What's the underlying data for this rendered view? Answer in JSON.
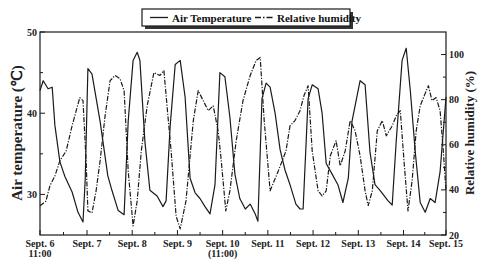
{
  "chart_data": {
    "type": "line",
    "title": "",
    "legend": {
      "position": "top-center",
      "entries": [
        {
          "label": "Air Temperature",
          "style": "solid"
        },
        {
          "label": "Relative humidity",
          "style": "dash-dot"
        }
      ]
    },
    "xlabel": "",
    "ylabel": "Air temperature (℃)",
    "ylabel_right": "Relative humidity (%)",
    "ylim": [
      25,
      50
    ],
    "ylim_right": [
      20,
      110
    ],
    "yticks": [
      30,
      40,
      50
    ],
    "yticks_right": [
      20,
      40,
      60,
      80,
      100
    ],
    "xlim_days": [
      0,
      8.98
    ],
    "xticks": [
      {
        "label": "Sept. 6",
        "sublabel": "11:00",
        "day": 0
      },
      {
        "label": "Sept. 7",
        "sublabel": "",
        "day": 1.04
      },
      {
        "label": "Sept. 8",
        "sublabel": "",
        "day": 2.04
      },
      {
        "label": "Sept. 9",
        "sublabel": "",
        "day": 3.04
      },
      {
        "label": "Sept. 10",
        "sublabel": "(11:00)",
        "day": 4.04
      },
      {
        "label": "Sept. 11",
        "sublabel": "",
        "day": 5.04
      },
      {
        "label": "Sept. 12",
        "sublabel": "",
        "day": 6.04
      },
      {
        "label": "Sept. 13",
        "sublabel": "",
        "day": 7.04
      },
      {
        "label": "Sept. 14",
        "sublabel": "",
        "day": 8.04
      },
      {
        "label": "Sept. 15",
        "sublabel": "",
        "day": 8.98
      }
    ],
    "x_unit": "days since Sept. 6 11:00",
    "grid": false,
    "series": [
      {
        "name": "Air Temperature",
        "axis": "left",
        "style": "solid",
        "x": [
          0,
          0.07,
          0.18,
          0.27,
          0.33,
          0.44,
          0.55,
          0.71,
          0.84,
          0.95,
          1.0,
          1.06,
          1.15,
          1.33,
          1.5,
          1.59,
          1.73,
          1.86,
          1.95,
          2.06,
          2.15,
          2.21,
          2.32,
          2.43,
          2.59,
          2.72,
          2.79,
          2.88,
          2.99,
          3.1,
          3.21,
          3.32,
          3.43,
          3.54,
          3.65,
          3.76,
          3.87,
          3.98,
          4.09,
          4.2,
          4.31,
          4.42,
          4.54,
          4.65,
          4.76,
          4.82,
          4.91,
          5.0,
          5.09,
          5.2,
          5.31,
          5.42,
          5.53,
          5.66,
          5.75,
          5.82,
          5.93,
          6.02,
          6.15,
          6.24,
          6.33,
          6.46,
          6.59,
          6.7,
          6.82,
          6.9,
          7.08,
          7.19,
          7.3,
          7.41,
          7.52,
          7.7,
          7.79,
          7.88,
          8.01,
          8.1,
          8.19,
          8.3,
          8.41,
          8.52,
          8.63,
          8.74,
          8.85,
          8.98
        ],
        "values": [
          42.8,
          44.0,
          43.0,
          43.2,
          38.5,
          34.0,
          32.2,
          30.3,
          27.8,
          26.6,
          31.8,
          45.5,
          44.8,
          39.0,
          32.3,
          30.5,
          28.0,
          27.5,
          39.0,
          46.5,
          47.5,
          46.5,
          36.5,
          30.5,
          29.8,
          28.5,
          29.2,
          38.5,
          46.0,
          46.5,
          42.0,
          32.0,
          30.2,
          29.5,
          28.5,
          27.6,
          31.2,
          45.0,
          44.5,
          39.5,
          32.5,
          29.5,
          28.2,
          28.8,
          27.6,
          26.7,
          41.8,
          43.7,
          43.2,
          40.0,
          35.5,
          33.0,
          31.2,
          28.8,
          28.2,
          28.2,
          41.8,
          43.5,
          43.0,
          40.0,
          33.8,
          32.5,
          31.2,
          29.0,
          32.0,
          39.0,
          44.0,
          43.5,
          35.2,
          31.2,
          30.5,
          29.2,
          28.7,
          36.7,
          46.5,
          48.0,
          42.8,
          35.2,
          29.0,
          27.8,
          29.5,
          29.0,
          32.8,
          42.0
        ]
      },
      {
        "name": "Relative humidity",
        "axis": "right",
        "style": "dash-dot",
        "x": [
          0,
          0.13,
          0.22,
          0.33,
          0.44,
          0.58,
          0.71,
          0.8,
          0.88,
          0.95,
          1.02,
          1.06,
          1.15,
          1.24,
          1.33,
          1.44,
          1.55,
          1.66,
          1.77,
          1.86,
          1.95,
          2.06,
          2.15,
          2.24,
          2.37,
          2.52,
          2.65,
          2.74,
          2.83,
          2.9,
          3.01,
          3.1,
          3.23,
          3.39,
          3.5,
          3.61,
          3.72,
          3.83,
          3.94,
          4.0,
          4.11,
          4.2,
          4.34,
          4.49,
          4.65,
          4.78,
          4.87,
          4.96,
          5.09,
          5.27,
          5.44,
          5.53,
          5.64,
          5.75,
          5.84,
          5.93,
          6.02,
          6.15,
          6.24,
          6.33,
          6.42,
          6.55,
          6.64,
          6.75,
          6.86,
          6.97,
          7.08,
          7.19,
          7.26,
          7.35,
          7.46,
          7.57,
          7.66,
          7.79,
          7.88,
          7.97,
          8.05,
          8.14,
          8.23,
          8.32,
          8.41,
          8.5,
          8.59,
          8.67,
          8.76,
          8.85,
          8.92,
          8.98
        ],
        "values": [
          33,
          35,
          41.8,
          46.2,
          52.9,
          57.3,
          68.4,
          75.1,
          80.9,
          79.6,
          52.9,
          30.7,
          29.8,
          39.6,
          52.9,
          72.9,
          88.4,
          90.7,
          89.3,
          84,
          48.4,
          24,
          35.1,
          57.3,
          77.3,
          92,
          90.7,
          92.9,
          72.9,
          57.3,
          28.4,
          22.7,
          35.1,
          70.7,
          84,
          79.6,
          75.1,
          77.3,
          66.2,
          55.1,
          30.7,
          39.6,
          61.8,
          79.6,
          90.7,
          97.3,
          98.7,
          70.7,
          39.6,
          48.4,
          57.3,
          68.4,
          70.7,
          75.1,
          81.8,
          86.2,
          57.3,
          39.6,
          37.3,
          39.6,
          55.1,
          61.8,
          50.7,
          57.3,
          70.7,
          66.2,
          55.1,
          39.6,
          33,
          39.6,
          66.2,
          70.7,
          64,
          68.4,
          72.9,
          75.1,
          52.9,
          30.7,
          44,
          66.2,
          77.3,
          81.8,
          86.2,
          79.6,
          80.9,
          75.1,
          57.3,
          39.6
        ]
      }
    ]
  },
  "legend": {
    "items": [
      {
        "label": "Air Temperature"
      },
      {
        "label": "Relative humidity"
      }
    ]
  },
  "axes": {
    "left_title": "Air temperature (℃)",
    "right_title": "Relative humidity (%)"
  },
  "colors": {
    "line": "#1a1a1a",
    "axis": "#1a1a1a",
    "background": "#ffffff"
  }
}
